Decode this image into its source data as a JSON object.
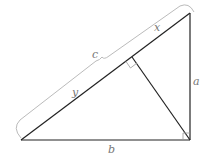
{
  "diagram": {
    "type": "right triangle with altitude to hypotenuse",
    "labels": {
      "hypotenuse": "c",
      "upper_segment": "x",
      "lower_segment": "y",
      "vertical_leg": "a",
      "horizontal_leg": "b"
    },
    "colors": {
      "lines": "#222222",
      "brace": "#bbbbbb",
      "labels": "#777777",
      "background": "#ffffff"
    }
  }
}
